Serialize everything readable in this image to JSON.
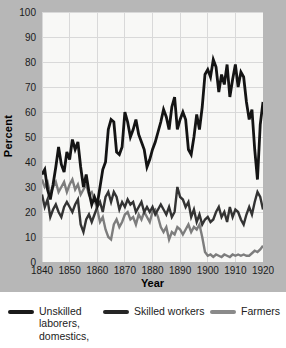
{
  "figure": {
    "y_axis": {
      "title": "Percent",
      "ticks": [
        "100",
        "90",
        "80",
        "70",
        "60",
        "50",
        "40",
        "30",
        "20",
        "10",
        "0"
      ]
    },
    "x_axis": {
      "title": "Year",
      "ticks": [
        "1840",
        "1850",
        "1860",
        "1870",
        "1880",
        "1890",
        "1900",
        "1910",
        "1920"
      ]
    },
    "colors": {
      "panel_bg": "#b7b7b7",
      "plot_bg": "#f8f8f6",
      "grid": "#d9d9d9",
      "text": "#1b1b1b",
      "legend_bg": "#ffffff"
    }
  },
  "legend": {
    "items": [
      {
        "label": "Unskilled laborers, domestics,",
        "color": "#1a1a1a"
      },
      {
        "label": "Skilled workers",
        "color": "#262626"
      },
      {
        "label": "Farmers",
        "color": "#8a8a8a"
      }
    ]
  },
  "chart_data": {
    "type": "line",
    "title": "",
    "xlabel": "Year",
    "ylabel": "Percent",
    "xlim": [
      1840,
      1920
    ],
    "ylim": [
      0,
      100
    ],
    "grid": true,
    "legend_position": "bottom",
    "x": [
      1840,
      1841,
      1842,
      1843,
      1844,
      1845,
      1846,
      1847,
      1848,
      1849,
      1850,
      1851,
      1852,
      1853,
      1854,
      1855,
      1856,
      1857,
      1858,
      1859,
      1860,
      1861,
      1862,
      1863,
      1864,
      1865,
      1866,
      1867,
      1868,
      1869,
      1870,
      1871,
      1872,
      1873,
      1874,
      1875,
      1876,
      1877,
      1878,
      1879,
      1880,
      1881,
      1882,
      1883,
      1884,
      1885,
      1886,
      1887,
      1888,
      1889,
      1890,
      1891,
      1892,
      1893,
      1894,
      1895,
      1896,
      1897,
      1898,
      1899,
      1900,
      1901,
      1902,
      1903,
      1904,
      1905,
      1906,
      1907,
      1908,
      1909,
      1910,
      1911,
      1912,
      1913,
      1914,
      1915,
      1916,
      1917,
      1918,
      1919,
      1920
    ],
    "series": [
      {
        "name": "Unskilled laborers, domestics,",
        "slug": "unskilled-laborers-domestics",
        "color": "#141414",
        "width": 2.8,
        "values": [
          35,
          37,
          29,
          25,
          31,
          38,
          46,
          39,
          36,
          44,
          41,
          49,
          45,
          48,
          38,
          30,
          35,
          28,
          23,
          26,
          23,
          30,
          37,
          40,
          53,
          57,
          56,
          44,
          43,
          46,
          60,
          56,
          50,
          53,
          57,
          51,
          48,
          45,
          38,
          41,
          45,
          48,
          52,
          56,
          61,
          58,
          53,
          62,
          66,
          53,
          57,
          60,
          57,
          45,
          43,
          50,
          59,
          53,
          62,
          75,
          77,
          74,
          81,
          78,
          68,
          75,
          71,
          79,
          66,
          73,
          79,
          70,
          76,
          74,
          64,
          57,
          61,
          45,
          33,
          55,
          64
        ]
      },
      {
        "name": "Skilled workers",
        "slug": "skilled-workers",
        "color": "#333333",
        "width": 2.4,
        "values": [
          27,
          22,
          25,
          18,
          21,
          23,
          20,
          18,
          22,
          24,
          22,
          20,
          23,
          25,
          15,
          12,
          17,
          19,
          16,
          19,
          22,
          24,
          20,
          26,
          28,
          24,
          28,
          26,
          21,
          24,
          22,
          25,
          23,
          24,
          20,
          22,
          24,
          20,
          22,
          20,
          22,
          19,
          21,
          23,
          21,
          19,
          22,
          18,
          20,
          30,
          26,
          25,
          22,
          24,
          18,
          21,
          16,
          19,
          15,
          17,
          18,
          16,
          17,
          20,
          22,
          18,
          20,
          16,
          22,
          18,
          21,
          20,
          17,
          15,
          19,
          22,
          19,
          24,
          28,
          26,
          21
        ]
      },
      {
        "name": "Farmers",
        "slug": "farmers",
        "color": "#7d7d7d",
        "width": 2.4,
        "values": [
          33,
          30,
          32,
          27,
          30,
          32,
          28,
          30,
          32,
          28,
          31,
          33,
          29,
          31,
          27,
          29,
          31,
          27,
          28,
          25,
          21,
          16,
          18,
          13,
          10,
          9,
          15,
          17,
          14,
          16,
          19,
          20,
          17,
          18,
          15,
          19,
          17,
          20,
          18,
          16,
          20,
          21,
          18,
          14,
          12,
          14,
          9,
          12,
          11,
          14,
          13,
          11,
          13,
          15,
          12,
          14,
          13,
          15,
          10,
          4,
          2.5,
          3,
          2,
          3,
          2.5,
          2,
          3,
          2.5,
          2,
          3,
          2.5,
          3,
          2.5,
          3,
          2.5,
          2.5,
          3.5,
          4.5,
          4,
          5,
          6.5
        ]
      }
    ]
  }
}
